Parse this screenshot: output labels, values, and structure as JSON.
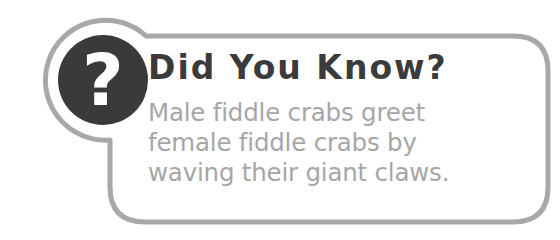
{
  "callout": {
    "title": "Did You Know?",
    "icon": "question-mark-icon",
    "body_lines": [
      "Male fiddle crabs greet",
      "female fiddle crabs by",
      "waving their giant claws."
    ],
    "icon_glyph": "?"
  },
  "colors": {
    "border": "#a8a8a8",
    "icon_circle": "#3a3a3a",
    "title": "#3b3b3b",
    "body_text": "#a6a6a6",
    "background": "#ffffff"
  }
}
